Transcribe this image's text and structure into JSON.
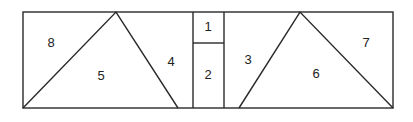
{
  "diagram": {
    "line_color": "#2a2a2a",
    "regions": [
      {
        "id": "1",
        "label": "1"
      },
      {
        "id": "2",
        "label": "2"
      },
      {
        "id": "3",
        "label": "3"
      },
      {
        "id": "4",
        "label": "4"
      },
      {
        "id": "5",
        "label": "5"
      },
      {
        "id": "6",
        "label": "6"
      },
      {
        "id": "7",
        "label": "7"
      },
      {
        "id": "8",
        "label": "8"
      }
    ]
  }
}
